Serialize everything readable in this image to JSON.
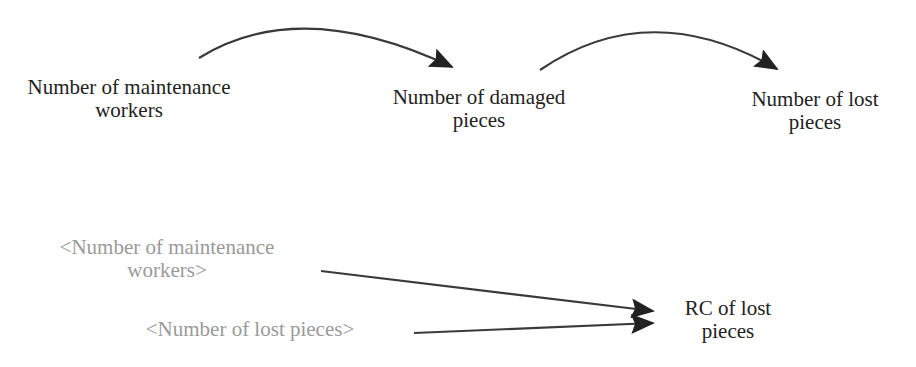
{
  "diagram": {
    "type": "causal-loop-fragment",
    "colors": {
      "background": "#ffffff",
      "variable_text": "#222222",
      "shadow_variable_text": "#9a9a9a",
      "arrow": "#3a3a3a",
      "arrowhead": "#222222"
    },
    "top_chain": {
      "variables": [
        {
          "id": "maintenance_workers",
          "line1": "Number of maintenance",
          "line2": "workers"
        },
        {
          "id": "damaged_pieces",
          "line1": "Number of damaged",
          "line2": "pieces"
        },
        {
          "id": "lost_pieces",
          "line1": "Number of lost",
          "line2": "pieces"
        }
      ],
      "links": [
        {
          "from": "maintenance_workers",
          "to": "damaged_pieces",
          "style": "curved-arrow"
        },
        {
          "from": "damaged_pieces",
          "to": "lost_pieces",
          "style": "curved-arrow"
        }
      ]
    },
    "bottom_chain": {
      "shadow_variables": [
        {
          "id": "shadow_maintenance_workers",
          "line1": "<Number of maintenance",
          "line2": "workers>"
        },
        {
          "id": "shadow_lost_pieces",
          "line1": "<Number of lost pieces>"
        }
      ],
      "target": {
        "id": "rc_lost_pieces",
        "line1": "RC of lost",
        "line2": "pieces"
      },
      "links": [
        {
          "from": "shadow_maintenance_workers",
          "to": "rc_lost_pieces",
          "style": "straight-arrow"
        },
        {
          "from": "shadow_lost_pieces",
          "to": "rc_lost_pieces",
          "style": "straight-arrow"
        }
      ]
    }
  }
}
